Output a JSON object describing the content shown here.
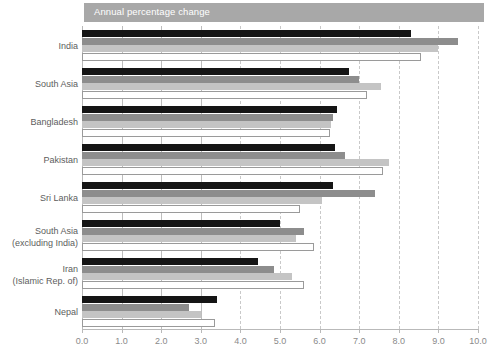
{
  "header": {
    "title": "Annual percentage change"
  },
  "chart_data": {
    "type": "bar",
    "orientation": "horizontal",
    "title": "Annual percentage change",
    "xlabel": "",
    "ylabel": "",
    "xlim": [
      0.0,
      10.0
    ],
    "xticks": [
      "0.0",
      "1.0",
      "2.0",
      "3.0",
      "4.0",
      "5.0",
      "6.0",
      "7.0",
      "8.0",
      "9.0",
      "10.0"
    ],
    "grid": true,
    "grid_axis": "x",
    "legend": "none",
    "categories": [
      "India",
      "South Asia",
      "Bangladesh",
      "Pakistan",
      "Sri Lanka",
      "South Asia (excluding India)",
      "Iran (Islamic Rep. of)",
      "Nepal"
    ],
    "category_labels": [
      {
        "line1": "India",
        "line2": ""
      },
      {
        "line1": "South Asia",
        "line2": ""
      },
      {
        "line1": "Bangladesh",
        "line2": ""
      },
      {
        "line1": "Pakistan",
        "line2": ""
      },
      {
        "line1": "Sri Lanka",
        "line2": ""
      },
      {
        "line1": "South Asia",
        "line2": "(excluding India)"
      },
      {
        "line1": "Iran",
        "line2": "(Islamic Rep. of)"
      },
      {
        "line1": "Nepal",
        "line2": ""
      }
    ],
    "series": [
      {
        "name": "series-1",
        "color": "#151515",
        "values": [
          8.3,
          6.75,
          6.45,
          6.4,
          6.35,
          5.0,
          4.45,
          3.4
        ]
      },
      {
        "name": "series-2",
        "color": "#8d8d8d",
        "values": [
          9.5,
          7.0,
          6.35,
          6.65,
          7.4,
          5.6,
          4.85,
          2.7
        ]
      },
      {
        "name": "series-3",
        "color": "#c4c4c4",
        "values": [
          9.0,
          7.55,
          6.3,
          7.75,
          6.05,
          5.4,
          5.3,
          3.0
        ]
      },
      {
        "name": "series-4",
        "color": "#ffffff",
        "values": [
          8.55,
          7.2,
          6.25,
          7.6,
          5.5,
          5.85,
          5.6,
          3.35
        ]
      }
    ]
  }
}
